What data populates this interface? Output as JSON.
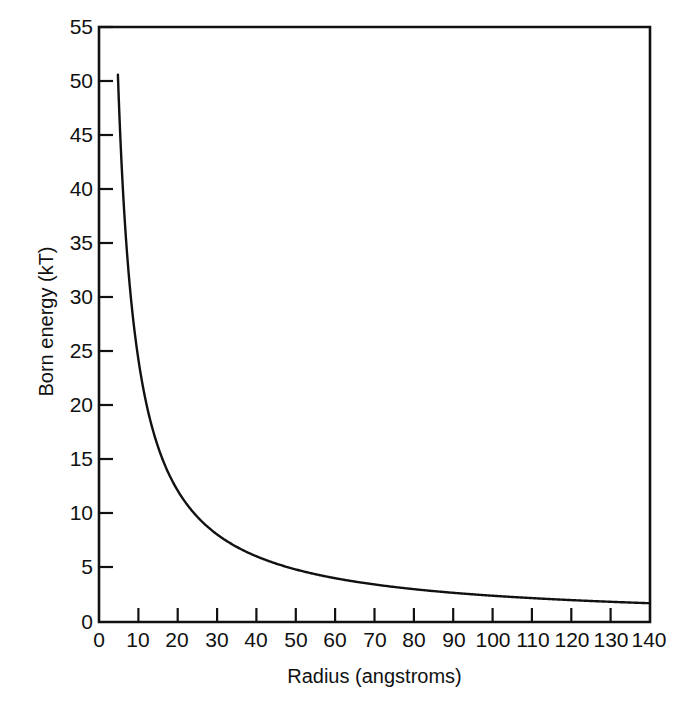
{
  "figure": {
    "name": "born-energy-vs-radius-plot",
    "background": "#ffffff",
    "ink_color": "#111111"
  },
  "chart_data": {
    "type": "line",
    "title": "",
    "subtitle": "",
    "xlabel": "Radius (angstroms)",
    "ylabel": "Born energy (kT)",
    "xlim": [
      0,
      140
    ],
    "ylim": [
      0,
      55
    ],
    "xticks": [
      0,
      10,
      20,
      30,
      40,
      50,
      60,
      70,
      80,
      90,
      100,
      110,
      120,
      130,
      140
    ],
    "yticks": [
      0,
      5,
      10,
      15,
      20,
      25,
      30,
      35,
      40,
      45,
      50,
      55
    ],
    "xtick_labels": [
      "0",
      "10",
      "20",
      "30",
      "40",
      "50",
      "60",
      "70",
      "80",
      "90",
      "100",
      "110",
      "120",
      "130",
      "140"
    ],
    "ytick_labels": [
      "0",
      "5",
      "10",
      "15",
      "20",
      "25",
      "30",
      "35",
      "40",
      "45",
      "50",
      "55"
    ],
    "grid": false,
    "legend": false,
    "legend_position": "none",
    "annotations": [],
    "series": [
      {
        "name": "Born energy",
        "relation": "E = 243 / r",
        "color": "#111111",
        "x": [
          4.8,
          5,
          6,
          7,
          8,
          9,
          10,
          11,
          12,
          13,
          14,
          15,
          16,
          17,
          18,
          19,
          20,
          22,
          24,
          26,
          28,
          30,
          33,
          36,
          40,
          45,
          50,
          55,
          60,
          65,
          70,
          75,
          80,
          85,
          90,
          95,
          100,
          110,
          120,
          130,
          140
        ],
        "y": [
          50.6,
          48.6,
          40.5,
          34.7,
          30.4,
          27.0,
          24.3,
          22.1,
          20.3,
          18.7,
          17.4,
          16.2,
          15.2,
          14.3,
          13.5,
          12.8,
          12.2,
          11.0,
          10.1,
          9.3,
          8.7,
          8.1,
          7.4,
          6.8,
          6.1,
          5.4,
          4.9,
          4.4,
          4.1,
          3.7,
          3.5,
          3.2,
          3.0,
          2.9,
          2.7,
          2.6,
          2.4,
          2.2,
          2.0,
          1.9,
          1.7
        ]
      }
    ]
  }
}
